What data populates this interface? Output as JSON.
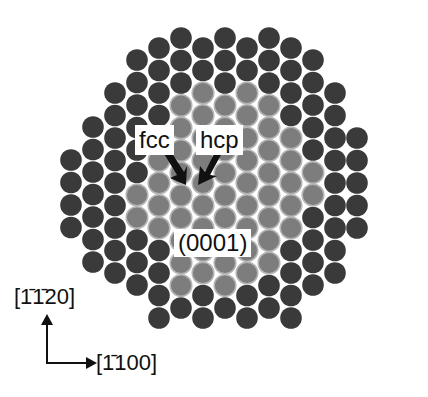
{
  "figure": {
    "labels": {
      "fcc": "fcc",
      "hcp": "hcp",
      "plane": "(0001)"
    },
    "axes": {
      "vertical": "[1̄1̄20]",
      "horizontal": "[1̄100]"
    },
    "colors": {
      "dark_atom": "#3a3a3a",
      "light_atom": "#7d7d7d",
      "light_atom_outline": "#b5b5b5",
      "background": "#ffffff",
      "text": "#111111"
    },
    "lattice": {
      "radius": 10.8,
      "column_spacing": 22,
      "row_spacing": 22.5,
      "x0": 71,
      "columns": [
        {
          "ymin": 160,
          "ymax": 228,
          "light": []
        },
        {
          "ymin": 127,
          "ymax": 262,
          "light": []
        },
        {
          "ymin": 93,
          "ymax": 295,
          "light": []
        },
        {
          "ymin": 60,
          "ymax": 307,
          "light": [
            195,
            218
          ]
        },
        {
          "ymin": 48,
          "ymax": 318,
          "light": [
            150,
            240
          ]
        },
        {
          "ymin": 38,
          "ymax": 330,
          "light": [
            100,
            285
          ]
        },
        {
          "ymin": 48,
          "ymax": 340,
          "light": [
            88,
            275
          ]
        },
        {
          "ymin": 38,
          "ymax": 330,
          "light": [
            100,
            285
          ]
        },
        {
          "ymin": 48,
          "ymax": 340,
          "light": [
            88,
            275
          ]
        },
        {
          "ymin": 38,
          "ymax": 330,
          "light": [
            100,
            262
          ]
        },
        {
          "ymin": 48,
          "ymax": 318,
          "light": [
            133,
            240
          ]
        },
        {
          "ymin": 60,
          "ymax": 307,
          "light": [
            160,
            195
          ]
        },
        {
          "ymin": 93,
          "ymax": 273,
          "light": []
        },
        {
          "ymin": 138,
          "ymax": 240,
          "light": []
        }
      ]
    }
  }
}
